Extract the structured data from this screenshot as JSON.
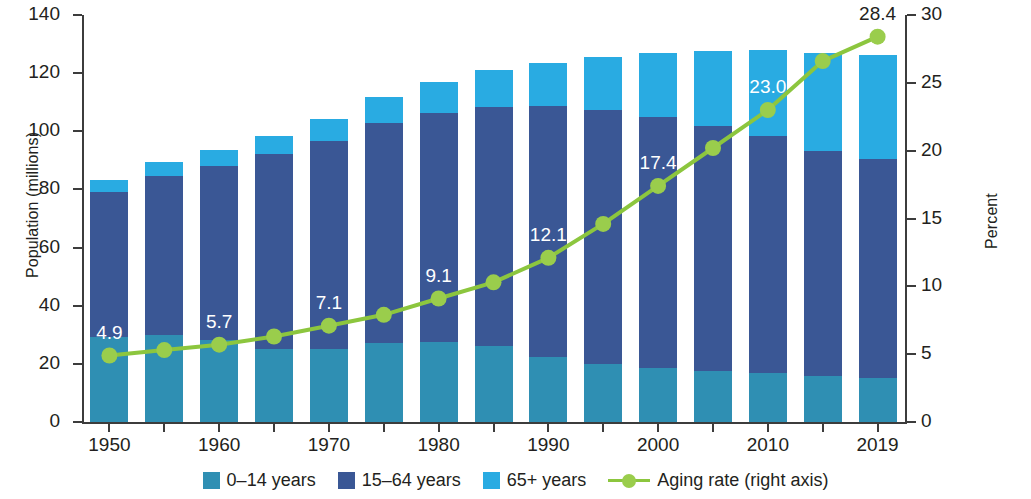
{
  "chart_data": {
    "type": "bar",
    "title": "",
    "subtitle": "",
    "xlabel": "",
    "ylabel": "Population (millions)",
    "ylabel_right": "Percent",
    "ylim": [
      0,
      140
    ],
    "ylim_right": [
      0,
      30
    ],
    "yticks": [
      0,
      20,
      40,
      60,
      80,
      100,
      120,
      140
    ],
    "yticks_right": [
      0,
      5,
      10,
      15,
      20,
      25,
      30
    ],
    "grid": false,
    "legend_position": "bottom",
    "categories": [
      "1950",
      "1955",
      "1960",
      "1965",
      "1970",
      "1975",
      "1980",
      "1985",
      "1990",
      "1995",
      "2000",
      "2005",
      "2010",
      "2015",
      "2019"
    ],
    "xtick_labels": [
      "1950",
      "",
      "1960",
      "",
      "1970",
      "",
      "1980",
      "",
      "1990",
      "",
      "2000",
      "",
      "2010",
      "",
      "2019"
    ],
    "series": [
      {
        "name": "0–14 years",
        "color": "#2f8fb3",
        "values": [
          29.4,
          29.8,
          28.1,
          25.2,
          25.2,
          27.2,
          27.5,
          26.0,
          22.5,
          20.0,
          18.5,
          17.5,
          16.8,
          15.9,
          15.2
        ]
      },
      {
        "name": "15–64 years",
        "color": "#3a5795",
        "values": [
          49.7,
          54.7,
          60.0,
          67.0,
          71.6,
          75.8,
          78.9,
          82.5,
          86.1,
          87.2,
          86.4,
          84.4,
          81.7,
          77.3,
          75.1
        ]
      },
      {
        "name": "65+ years",
        "color": "#29abe2",
        "values": [
          4.1,
          4.8,
          5.4,
          6.2,
          7.4,
          8.9,
          10.6,
          12.5,
          14.9,
          18.3,
          22.0,
          25.7,
          29.5,
          33.9,
          35.9
        ]
      }
    ],
    "line_series": {
      "name": "Aging rate (right axis)",
      "color": "#8cc63e",
      "marker_color": "#9acd4c",
      "axis": "right",
      "values": [
        4.9,
        5.3,
        5.7,
        6.3,
        7.1,
        7.9,
        9.1,
        10.3,
        12.1,
        14.6,
        17.4,
        20.2,
        23.0,
        26.6,
        28.4
      ],
      "labeled_points": [
        {
          "category": "1950",
          "value": 4.9,
          "label": "4.9"
        },
        {
          "category": "1960",
          "value": 5.7,
          "label": "5.7"
        },
        {
          "category": "1970",
          "value": 7.1,
          "label": "7.1"
        },
        {
          "category": "1980",
          "value": 9.1,
          "label": "9.1"
        },
        {
          "category": "1990",
          "value": 12.1,
          "label": "12.1"
        },
        {
          "category": "2000",
          "value": 17.4,
          "label": "17.4"
        },
        {
          "category": "2010",
          "value": 23.0,
          "label": "23.0"
        },
        {
          "category": "2019",
          "value": 28.4,
          "label": "28.4"
        }
      ]
    }
  },
  "legend": {
    "items": [
      {
        "label": "0–14 years",
        "swatch": "#2f8fb3",
        "type": "swatch"
      },
      {
        "label": "15–64 years",
        "swatch": "#3a5795",
        "type": "swatch"
      },
      {
        "label": "65+ years",
        "swatch": "#29abe2",
        "type": "swatch"
      },
      {
        "label": "Aging rate (right axis)",
        "swatch": "#8cc63e",
        "type": "line-marker"
      }
    ]
  },
  "colors": {
    "age_0_14": "#2f8fb3",
    "age_15_64": "#3a5795",
    "age_65_plus": "#29abe2",
    "aging_rate_line": "#8cc63e",
    "aging_rate_marker": "#9acd4c",
    "axis": "#3c3c3c",
    "text": "#231f20",
    "background": "#ffffff"
  }
}
